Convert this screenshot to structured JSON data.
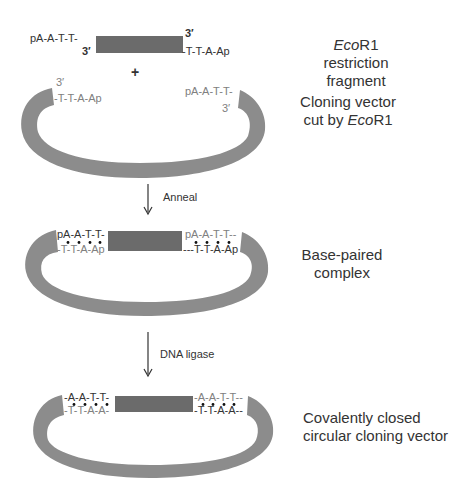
{
  "colors": {
    "insert": "#6b6b6b",
    "vector": "#8c8c8c",
    "text_dark": "#333333",
    "text_grey": "#808080",
    "background": "#ffffff"
  },
  "stage1": {
    "top_left_seq": "pA-A-T-T-",
    "top_right_prime": "3′",
    "bottom_left_prime": "3′",
    "bottom_right_seq": "-T-T-A-Ap",
    "label_italic": "Eco",
    "label_rest": "R1 restriction",
    "label_line2": "fragment"
  },
  "plus": "+",
  "stage2": {
    "left_prime": "3′",
    "left_seq": "-T-T-A-Ap",
    "right_seq": "pA-A-T-T-",
    "right_prime": "3′",
    "label_line1": "Cloning vector",
    "label_line2_pre": "cut by ",
    "label_line2_italic": "Eco",
    "label_line2_post": "R1"
  },
  "arrow1": {
    "label": "Anneal"
  },
  "stage3": {
    "left_top_seq": "pA-A-T-T-",
    "left_bottom_seq": "-T-T-A-Ap",
    "right_top_seq": "pA-A-T-T--",
    "right_bottom_seq": "---T-T-A-Ap",
    "label_line1": "Base-paired",
    "label_line2": "complex"
  },
  "arrow2": {
    "label": "DNA ligase"
  },
  "stage4": {
    "left_top_seq": "-A-A-T-T-",
    "left_bottom_seq": "-T-T-A-A-",
    "right_top_seq": "-A-A-T-T--",
    "right_bottom_seq": "-T-T-A-A--",
    "label_line1": "Covalently closed",
    "label_line2": "circular cloning vector"
  }
}
